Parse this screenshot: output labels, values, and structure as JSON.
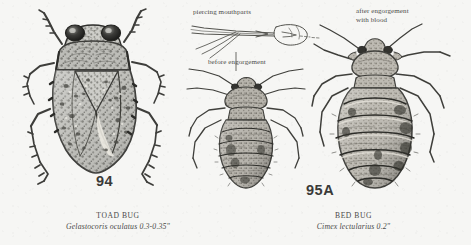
{
  "page": {
    "background_color": "#f6f6f4",
    "ink_color": "#3b3b3b",
    "kind": "field-guide plate"
  },
  "figures": [
    {
      "id": "toad-bug",
      "number": "94",
      "common_name": "TOAD BUG",
      "scientific_name": "Gelastocoris oculatus 0.3-0.35\"",
      "annotations": []
    },
    {
      "id": "bed-bug",
      "number": "95A",
      "common_name": "BED BUG",
      "scientific_name": "Cimex lectularius  0.2\"",
      "annotations": [
        {
          "id": "piercing-mouthparts",
          "text": "piercing mouthparts"
        },
        {
          "id": "before-engorgement",
          "text": "before engorgement"
        },
        {
          "id": "after-engorgement",
          "line1": "after engorgement",
          "line2": "with blood"
        }
      ]
    }
  ],
  "labels": {
    "toad_bug_number": "94",
    "toad_bug_common": "TOAD BUG",
    "toad_bug_scientific": "Gelastocoris oculatus 0.3-0.35\"",
    "bed_bug_number": "95A",
    "bed_bug_common": "BED BUG",
    "bed_bug_scientific": "Cimex lectularius  0.2\"",
    "piercing_mouthparts": "piercing mouthparts",
    "before_engorgement": "before engorgement",
    "after_engorgement_1": "after engorgement",
    "after_engorgement_2": "with blood"
  }
}
